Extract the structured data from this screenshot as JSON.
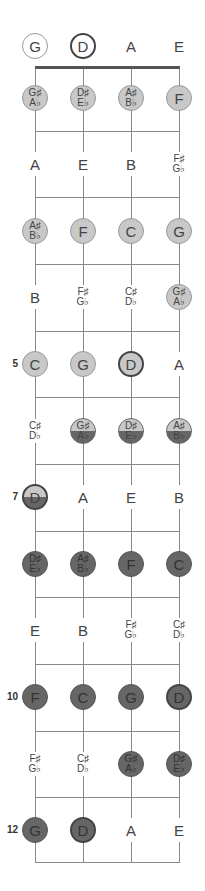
{
  "diagram": {
    "title": "",
    "strings": [
      "G",
      "D",
      "A",
      "E"
    ],
    "string_x": [
      35,
      83,
      131,
      179
    ],
    "nut_y": 67,
    "fret_lines_y": [
      131,
      197,
      264,
      331,
      397,
      464,
      531,
      597,
      664,
      731,
      797,
      862
    ],
    "row_y": [
      46,
      98,
      164,
      231,
      297,
      364,
      431,
      497,
      564,
      630,
      697,
      764,
      830
    ],
    "fret_numbers": [
      {
        "fret": 5,
        "label": "5"
      },
      {
        "fret": 7,
        "label": "7"
      },
      {
        "fret": 10,
        "label": "10"
      },
      {
        "fret": 12,
        "label": "12"
      }
    ],
    "colors": {
      "light_fill": "#c8c8c8",
      "dark_fill": "#666666",
      "line": "#888888",
      "nut": "#555555"
    },
    "rows": [
      {
        "fret": 0,
        "notes": [
          {
            "top": "G",
            "style": "open"
          },
          {
            "top": "D",
            "style": "open root"
          },
          {
            "top": "A",
            "style": "plain"
          },
          {
            "top": "E",
            "style": "plain"
          }
        ]
      },
      {
        "fret": 1,
        "notes": [
          {
            "top": "G♯",
            "bottom": "A♭",
            "style": "light"
          },
          {
            "top": "D♯",
            "bottom": "E♭",
            "style": "light"
          },
          {
            "top": "A♯",
            "bottom": "B♭",
            "style": "light"
          },
          {
            "top": "F",
            "style": "light"
          }
        ]
      },
      {
        "fret": 2,
        "notes": [
          {
            "top": "A",
            "style": "plain"
          },
          {
            "top": "E",
            "style": "plain"
          },
          {
            "top": "B",
            "style": "plain"
          },
          {
            "top": "F♯",
            "bottom": "G♭",
            "style": "plain"
          }
        ]
      },
      {
        "fret": 3,
        "notes": [
          {
            "top": "A♯",
            "bottom": "B♭",
            "style": "light"
          },
          {
            "top": "F",
            "style": "light"
          },
          {
            "top": "C",
            "style": "light"
          },
          {
            "top": "G",
            "style": "light"
          }
        ]
      },
      {
        "fret": 4,
        "notes": [
          {
            "top": "B",
            "style": "plain"
          },
          {
            "top": "F♯",
            "bottom": "G♭",
            "style": "plain"
          },
          {
            "top": "C♯",
            "bottom": "D♭",
            "style": "plain"
          },
          {
            "top": "G♯",
            "bottom": "A♭",
            "style": "light"
          }
        ]
      },
      {
        "fret": 5,
        "notes": [
          {
            "top": "C",
            "style": "light"
          },
          {
            "top": "G",
            "style": "light"
          },
          {
            "top": "D",
            "style": "light root"
          },
          {
            "top": "A",
            "style": "plain"
          }
        ]
      },
      {
        "fret": 6,
        "notes": [
          {
            "top": "C♯",
            "bottom": "D♭",
            "style": "plain"
          },
          {
            "top": "G♯",
            "bottom": "A♭",
            "style": "split"
          },
          {
            "top": "D♯",
            "bottom": "E♭",
            "style": "split"
          },
          {
            "top": "A♯",
            "bottom": "B♭",
            "style": "split"
          }
        ]
      },
      {
        "fret": 7,
        "notes": [
          {
            "top": "D",
            "style": "split root"
          },
          {
            "top": "A",
            "style": "plain"
          },
          {
            "top": "E",
            "style": "plain"
          },
          {
            "top": "B",
            "style": "plain"
          }
        ]
      },
      {
        "fret": 8,
        "notes": [
          {
            "top": "D♯",
            "bottom": "E♭",
            "style": "dark"
          },
          {
            "top": "A♯",
            "bottom": "B♭",
            "style": "dark"
          },
          {
            "top": "F",
            "style": "dark"
          },
          {
            "top": "C",
            "style": "dark"
          }
        ]
      },
      {
        "fret": 9,
        "notes": [
          {
            "top": "E",
            "style": "plain"
          },
          {
            "top": "B",
            "style": "plain"
          },
          {
            "top": "F♯",
            "bottom": "G♭",
            "style": "plain"
          },
          {
            "top": "C♯",
            "bottom": "D♭",
            "style": "plain"
          }
        ]
      },
      {
        "fret": 10,
        "notes": [
          {
            "top": "F",
            "style": "dark"
          },
          {
            "top": "C",
            "style": "dark"
          },
          {
            "top": "G",
            "style": "dark"
          },
          {
            "top": "D",
            "style": "dark root"
          }
        ]
      },
      {
        "fret": 11,
        "notes": [
          {
            "top": "F♯",
            "bottom": "G♭",
            "style": "plain"
          },
          {
            "top": "C♯",
            "bottom": "D♭",
            "style": "plain"
          },
          {
            "top": "G♯",
            "bottom": "A♭",
            "style": "dark"
          },
          {
            "top": "D♯",
            "bottom": "E♭",
            "style": "dark"
          }
        ]
      },
      {
        "fret": 12,
        "notes": [
          {
            "top": "G",
            "style": "dark"
          },
          {
            "top": "D",
            "style": "dark root"
          },
          {
            "top": "A",
            "style": "plain"
          },
          {
            "top": "E",
            "style": "plain"
          }
        ]
      }
    ]
  }
}
